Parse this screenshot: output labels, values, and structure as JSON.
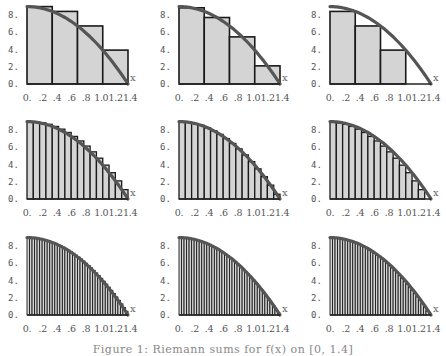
{
  "figure": {
    "caption": "Figure 1: Riemann sums for f(x) on [0, 1.4]"
  },
  "style": {
    "bar_fill": "#d4d4d4",
    "bar_stroke": "#1a1a1a",
    "curve_color": "#555555",
    "axis_color": "#222222",
    "label_color": "#555555"
  },
  "layout": {
    "columns_x": [
      27,
      179,
      330
    ],
    "rows_baseline": [
      84,
      199,
      315
    ],
    "plot_width": 101,
    "px_per_unit_y": 8.6
  },
  "chart_data": {
    "type": "bar",
    "function": "f(x) = 9(1 - x^2/1.96)",
    "xlabel": "x",
    "ylabel": "",
    "xlim": [
      0,
      1.4
    ],
    "ylim": [
      0,
      9
    ],
    "x_tick_labels": [
      "0.",
      ".2",
      ".4",
      ".6",
      ".8",
      "1.0",
      "1.2",
      "1.4"
    ],
    "y_tick_labels": [
      "0.",
      "2.",
      "4.",
      "6.",
      "8."
    ],
    "y_tick_values": [
      0,
      2,
      4,
      6,
      8
    ],
    "grid": false,
    "columns": [
      "left endpoint",
      "midpoint",
      "right endpoint"
    ],
    "rows_n": [
      4,
      16,
      40
    ],
    "panels": [
      {
        "row": 0,
        "col": 0,
        "rule": "left",
        "n": 4,
        "heights": [
          9.0,
          8.44,
          6.75,
          3.94
        ]
      },
      {
        "row": 0,
        "col": 1,
        "rule": "mid",
        "n": 4,
        "heights": [
          8.86,
          7.73,
          5.48,
          2.11
        ]
      },
      {
        "row": 0,
        "col": 2,
        "rule": "right",
        "n": 4,
        "heights": [
          8.44,
          6.75,
          3.94,
          0.0
        ]
      },
      {
        "row": 1,
        "col": 0,
        "rule": "left",
        "n": 16
      },
      {
        "row": 1,
        "col": 1,
        "rule": "mid",
        "n": 16
      },
      {
        "row": 1,
        "col": 2,
        "rule": "right",
        "n": 16
      },
      {
        "row": 2,
        "col": 0,
        "rule": "left",
        "n": 40
      },
      {
        "row": 2,
        "col": 1,
        "rule": "mid",
        "n": 40
      },
      {
        "row": 2,
        "col": 2,
        "rule": "right",
        "n": 40
      }
    ]
  }
}
